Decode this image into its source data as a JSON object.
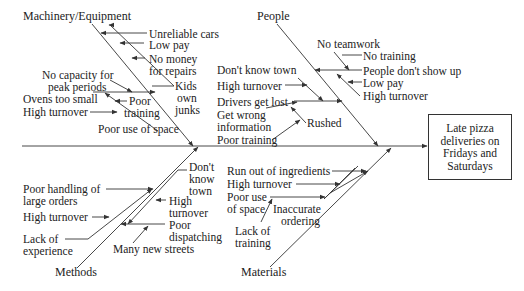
{
  "diagram": {
    "type": "fishbone",
    "effect": "Late pizza deliveries on Fridays and Saturdays",
    "categories": {
      "machinery": {
        "label": "Machinery/Equipment",
        "causes": [
          "Unreliable cars",
          "Low pay",
          "No money for repairs",
          "Kids own junks",
          "No capacity for peak periods",
          "Ovens too small",
          "Poor training",
          "High turnover",
          "Poor use of space"
        ]
      },
      "people": {
        "label": "People",
        "causes": [
          "No teamwork",
          "No training",
          "People don't show up",
          "Low pay",
          "High turnover",
          "Don't know town",
          "High turnover",
          "Drivers get lost",
          "Get wrong information",
          "Rushed",
          "Poor training"
        ]
      },
      "methods": {
        "label": "Methods",
        "causes": [
          "Poor handling of large orders",
          "High turnover",
          "Lack of experience",
          "Don't know town",
          "High turnover",
          "Poor dispatching",
          "Many new streets"
        ]
      },
      "materials": {
        "label": "Materials",
        "causes": [
          "Run out of ingredients",
          "High turnover",
          "Poor use of space",
          "Inaccurate ordering",
          "Lack of training"
        ]
      }
    }
  },
  "labels": {
    "mach_unreliable": "Unreliable cars",
    "mach_lowpay": "Low pay",
    "mach_nomoney1": "No money",
    "mach_nomoney2": "for repairs",
    "mach_kids1": "Kids",
    "mach_kids2": "own",
    "mach_kids3": "junks",
    "mach_nocap1": "No capacity for",
    "mach_nocap2": "peak periods",
    "mach_ovens": "Ovens too small",
    "mach_hightu": "High turnover",
    "mach_poortr1": "Poor",
    "mach_poortr2": "training",
    "mach_space": "Poor use of space",
    "ppl_noteam": "No teamwork",
    "ppl_notrain": "No training",
    "ppl_noshow": "People don't show up",
    "ppl_lowpay": "Low pay",
    "ppl_hightu": "High turnover",
    "ppl_dontknow": "Don't know town",
    "ppl_hightu2": "High turnover",
    "ppl_lost": "Drivers get lost",
    "ppl_wrong1": "Get wrong",
    "ppl_wrong2": "information",
    "ppl_rushed": "Rushed",
    "ppl_poortr": "Poor training",
    "meth_poorh1": "Poor handling of",
    "meth_poorh2": "large orders",
    "meth_hightu": "High turnover",
    "meth_lack1": "Lack of",
    "meth_lack2": "experience",
    "meth_dk1": "Don't",
    "meth_dk2": "know",
    "meth_dk3": "town",
    "meth_ht1": "High",
    "meth_ht2": "turnover",
    "meth_pd1": "Poor",
    "meth_pd2": "dispatching",
    "meth_streets": "Many new streets",
    "mat_runout": "Run out of ingredients",
    "mat_hightu": "High turnover",
    "mat_space1": "Poor use",
    "mat_space2": "of space",
    "mat_inacc1": "Inaccurate",
    "mat_inacc2": "ordering",
    "mat_lack1": "Lack of",
    "mat_lack2": "training"
  },
  "colors": {
    "line": "#333333",
    "text": "#222222",
    "background": "#ffffff"
  }
}
